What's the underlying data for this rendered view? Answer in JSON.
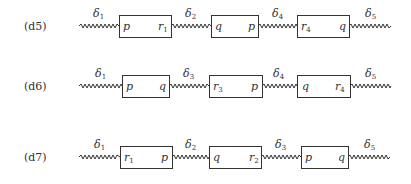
{
  "diagram": {
    "rows": [
      {
        "label": "(d5)",
        "springs": [
          {
            "symbol": "δ",
            "index": "1"
          },
          {
            "symbol": "δ",
            "index": "2"
          },
          {
            "symbol": "δ",
            "index": "4"
          },
          {
            "symbol": "δ",
            "index": "5"
          }
        ],
        "boxes": [
          {
            "left": {
              "sym": "p",
              "sub": ""
            },
            "right": {
              "sym": "r",
              "sub": "1"
            }
          },
          {
            "left": {
              "sym": "q",
              "sub": ""
            },
            "right": {
              "sym": "p",
              "sub": ""
            }
          },
          {
            "left": {
              "sym": "r",
              "sub": "4"
            },
            "right": {
              "sym": "q",
              "sub": ""
            }
          }
        ]
      },
      {
        "label": "(d6)",
        "springs": [
          {
            "symbol": "δ",
            "index": "1"
          },
          {
            "symbol": "δ",
            "index": "3"
          },
          {
            "symbol": "δ",
            "index": "4"
          },
          {
            "symbol": "δ",
            "index": "5"
          }
        ],
        "boxes": [
          {
            "left": {
              "sym": "p",
              "sub": ""
            },
            "right": {
              "sym": "q",
              "sub": ""
            }
          },
          {
            "left": {
              "sym": "r",
              "sub": "3"
            },
            "right": {
              "sym": "p",
              "sub": ""
            }
          },
          {
            "left": {
              "sym": "q",
              "sub": ""
            },
            "right": {
              "sym": "r",
              "sub": "4"
            }
          }
        ]
      },
      {
        "label": "(d7)",
        "springs": [
          {
            "symbol": "δ",
            "index": "1"
          },
          {
            "symbol": "δ",
            "index": "2"
          },
          {
            "symbol": "δ",
            "index": "3"
          },
          {
            "symbol": "δ",
            "index": "5"
          }
        ],
        "boxes": [
          {
            "left": {
              "sym": "r",
              "sub": "1"
            },
            "right": {
              "sym": "p",
              "sub": ""
            }
          },
          {
            "left": {
              "sym": "q",
              "sub": ""
            },
            "right": {
              "sym": "r",
              "sub": "2"
            }
          },
          {
            "left": {
              "sym": "p",
              "sub": ""
            },
            "right": {
              "sym": "q",
              "sub": ""
            }
          }
        ]
      }
    ]
  }
}
